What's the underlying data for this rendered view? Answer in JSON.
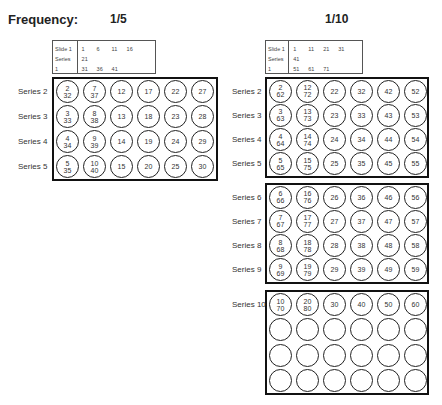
{
  "title": "Frequency:",
  "panels": [
    {
      "frequency": "1/5",
      "legend": {
        "labels": [
          "Slide 1",
          "Series 1"
        ],
        "values": [
          "1",
          "6",
          "11",
          "16",
          "21",
          "31",
          "36",
          "41"
        ]
      },
      "groups": [
        {
          "rows": [
            {
              "label": "Series 2",
              "cells": [
                [
                  "2",
                  "32"
                ],
                [
                  "7",
                  "37"
                ],
                [
                  "12"
                ],
                [
                  "17"
                ],
                [
                  "22"
                ],
                [
                  "27"
                ]
              ]
            },
            {
              "label": "Series 3",
              "cells": [
                [
                  "3",
                  "33"
                ],
                [
                  "8",
                  "38"
                ],
                [
                  "13"
                ],
                [
                  "18"
                ],
                [
                  "23"
                ],
                [
                  "28"
                ]
              ]
            },
            {
              "label": "Series 4",
              "cells": [
                [
                  "4",
                  "34"
                ],
                [
                  "9",
                  "39"
                ],
                [
                  "14"
                ],
                [
                  "19"
                ],
                [
                  "24"
                ],
                [
                  "29"
                ]
              ]
            },
            {
              "label": "Series 5",
              "cells": [
                [
                  "5",
                  "35"
                ],
                [
                  "10",
                  "40"
                ],
                [
                  "15"
                ],
                [
                  "20"
                ],
                [
                  "25"
                ],
                [
                  "30"
                ]
              ]
            }
          ]
        }
      ]
    },
    {
      "frequency": "1/10",
      "legend": {
        "labels": [
          "Slide 1",
          "Series 1"
        ],
        "values": [
          "1",
          "11",
          "21",
          "31",
          "41",
          "51",
          "61",
          "71"
        ]
      },
      "groups": [
        {
          "rows": [
            {
              "label": "Series 2",
              "cells": [
                [
                  "2",
                  "62"
                ],
                [
                  "12",
                  "72"
                ],
                [
                  "22"
                ],
                [
                  "32"
                ],
                [
                  "42"
                ],
                [
                  "52"
                ]
              ]
            },
            {
              "label": "Series 3",
              "cells": [
                [
                  "3",
                  "63"
                ],
                [
                  "13",
                  "73"
                ],
                [
                  "23"
                ],
                [
                  "33"
                ],
                [
                  "43"
                ],
                [
                  "53"
                ]
              ]
            },
            {
              "label": "Series 4",
              "cells": [
                [
                  "4",
                  "64"
                ],
                [
                  "14",
                  "74"
                ],
                [
                  "24"
                ],
                [
                  "34"
                ],
                [
                  "44"
                ],
                [
                  "54"
                ]
              ]
            },
            {
              "label": "Series 5",
              "cells": [
                [
                  "5",
                  "65"
                ],
                [
                  "15",
                  "75"
                ],
                [
                  "25"
                ],
                [
                  "35"
                ],
                [
                  "45"
                ],
                [
                  "55"
                ]
              ]
            }
          ]
        },
        {
          "rows": [
            {
              "label": "Series 6",
              "cells": [
                [
                  "6",
                  "66"
                ],
                [
                  "16",
                  "76"
                ],
                [
                  "26"
                ],
                [
                  "36"
                ],
                [
                  "46"
                ],
                [
                  "56"
                ]
              ]
            },
            {
              "label": "Series 7",
              "cells": [
                [
                  "7",
                  "67"
                ],
                [
                  "17",
                  "77"
                ],
                [
                  "27"
                ],
                [
                  "37"
                ],
                [
                  "47"
                ],
                [
                  "57"
                ]
              ]
            },
            {
              "label": "Series 8",
              "cells": [
                [
                  "8",
                  "68"
                ],
                [
                  "18",
                  "78"
                ],
                [
                  "28"
                ],
                [
                  "38"
                ],
                [
                  "48"
                ],
                [
                  "58"
                ]
              ]
            },
            {
              "label": "Series 9",
              "cells": [
                [
                  "9",
                  "69"
                ],
                [
                  "19",
                  "79"
                ],
                [
                  "29"
                ],
                [
                  "39"
                ],
                [
                  "49"
                ],
                [
                  "59"
                ]
              ]
            }
          ]
        },
        {
          "rows": [
            {
              "label": "Series 10",
              "cells": [
                [
                  "10",
                  "70"
                ],
                [
                  "20",
                  "80"
                ],
                [
                  "30"
                ],
                [
                  "40"
                ],
                [
                  "50"
                ],
                [
                  "60"
                ]
              ]
            },
            {
              "label": "",
              "cells": [
                [],
                [],
                [],
                [],
                [],
                []
              ]
            },
            {
              "label": "",
              "cells": [
                [],
                [],
                [],
                [],
                [],
                []
              ]
            },
            {
              "label": "",
              "cells": [
                [],
                [],
                [],
                [],
                [],
                []
              ]
            }
          ]
        }
      ]
    }
  ]
}
